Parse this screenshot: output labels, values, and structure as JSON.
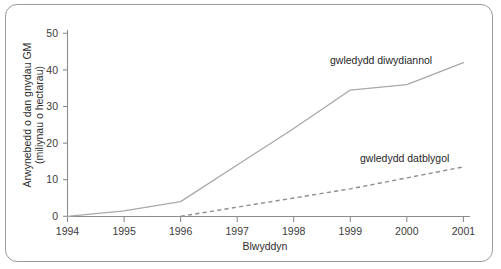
{
  "chart_data": {
    "type": "line",
    "title": "",
    "xlabel": "Blwyddyn",
    "ylabel": "Arwynebedd o dan gnydau GM (miliynau o hectarau)",
    "ylabel_line1": "Arwynebedd o dan gnydau GM",
    "ylabel_line2": "(miliynau o hectarau)",
    "x": [
      1994,
      1995,
      1996,
      1997,
      1998,
      1999,
      2000,
      2001
    ],
    "xlim": [
      1994,
      2001
    ],
    "ylim": [
      0,
      50
    ],
    "yticks": [
      0,
      10,
      20,
      30,
      40,
      50
    ],
    "xticks": [
      "1994",
      "1995",
      "1996",
      "1997",
      "1998",
      "1999",
      "2000",
      "2001"
    ],
    "grid": false,
    "legend": "inline-annotations",
    "series": [
      {
        "name": "gwledydd diwydiannol",
        "style": "solid",
        "color": "#a8a8a8",
        "x": [
          1994,
          1995,
          1996,
          1997,
          1998,
          1999,
          2000,
          2001
        ],
        "values": [
          0,
          1.5,
          4.0,
          14.0,
          24.0,
          34.5,
          36.0,
          42.0
        ]
      },
      {
        "name": "gwledydd datblygol",
        "style": "dashed",
        "color": "#8e8e8e",
        "x": [
          1996,
          1997,
          1998,
          1999,
          2000,
          2001
        ],
        "values": [
          0,
          2.5,
          5.0,
          7.5,
          10.5,
          13.5
        ]
      }
    ],
    "annotations": [
      {
        "text": "gwledydd diwydiannol",
        "series": "gwledydd diwydiannol"
      },
      {
        "text": "gwledydd datblygol",
        "series": "gwledydd datblygol"
      }
    ]
  },
  "axis": {
    "y_tick_labels": [
      "50",
      "40",
      "30",
      "20",
      "10",
      "0"
    ],
    "x_tick_labels": [
      "1994",
      "1995",
      "1996",
      "1997",
      "1998",
      "1999",
      "2000",
      "2001"
    ]
  },
  "colors": {
    "frame": "#9a9a9a",
    "axis": "#8c8c8c",
    "solid_series": "#a8a8a8",
    "dashed_series": "#8e8e8e",
    "text": "#2e2e2e",
    "background": "#ffffff"
  }
}
